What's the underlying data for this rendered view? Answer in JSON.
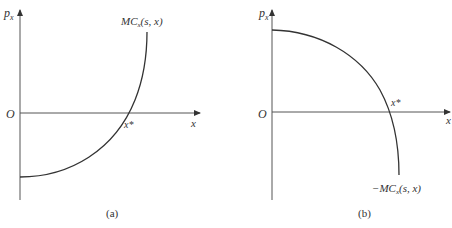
{
  "panels": [
    {
      "id": "a",
      "caption": "(a)",
      "y_axis_label": "p",
      "y_axis_sub": "x",
      "x_axis_label": "x",
      "origin_label": "O",
      "intersection_label": "x*",
      "curve_label": "MC",
      "curve_label_sub": "x",
      "curve_label_args": "(s, x)",
      "curve_shape": "convex increasing, negative at x=0, crossing zero at x*"
    },
    {
      "id": "b",
      "caption": "(b)",
      "y_axis_label": "p",
      "y_axis_sub": "x",
      "x_axis_label": "x",
      "origin_label": "O",
      "intersection_label": "x*",
      "curve_label": "−MC",
      "curve_label_sub": "x",
      "curve_label_args": "(s, x)",
      "curve_shape": "concave decreasing, positive at x=0, crossing zero at x*"
    }
  ],
  "colors": {
    "axis": "#444444",
    "curve": "#333333",
    "text": "#333333"
  }
}
